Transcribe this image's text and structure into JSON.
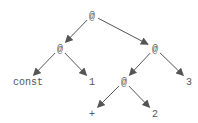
{
  "diagram": {
    "title": "",
    "type": "tree",
    "nodes": [
      {
        "id": "n0",
        "label": "@"
      },
      {
        "id": "n1",
        "label": "@"
      },
      {
        "id": "n2",
        "label": "@"
      },
      {
        "id": "n3",
        "label": "const"
      },
      {
        "id": "n4",
        "label": "1"
      },
      {
        "id": "n5",
        "label": "@"
      },
      {
        "id": "n6",
        "label": "3"
      },
      {
        "id": "n7",
        "label": "+"
      },
      {
        "id": "n8",
        "label": "2"
      }
    ],
    "edges": [
      {
        "from": "n0",
        "to": "n1"
      },
      {
        "from": "n0",
        "to": "n2"
      },
      {
        "from": "n1",
        "to": "n3"
      },
      {
        "from": "n1",
        "to": "n4"
      },
      {
        "from": "n2",
        "to": "n5"
      },
      {
        "from": "n2",
        "to": "n6"
      },
      {
        "from": "n5",
        "to": "n7"
      },
      {
        "from": "n5",
        "to": "n8"
      }
    ]
  }
}
